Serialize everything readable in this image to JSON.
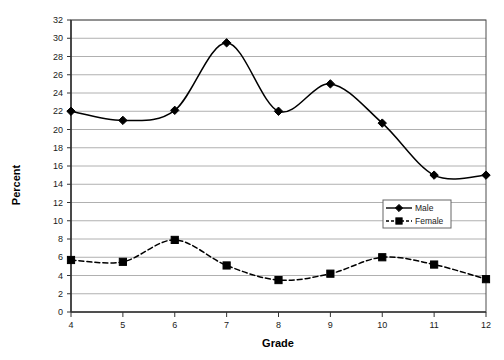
{
  "chart_data": {
    "type": "line",
    "title": "",
    "xlabel": "Grade",
    "ylabel": "Percent",
    "x": [
      4,
      5,
      6,
      7,
      8,
      9,
      10,
      11,
      12
    ],
    "categories": [
      "4",
      "5",
      "6",
      "7",
      "8",
      "9",
      "10",
      "11",
      "12"
    ],
    "xlim": [
      4,
      12
    ],
    "ylim": [
      0,
      32
    ],
    "ytick_step": 2,
    "yticks": [
      0,
      2,
      4,
      6,
      8,
      10,
      12,
      14,
      16,
      18,
      20,
      22,
      24,
      26,
      28,
      30,
      32
    ],
    "ytick_labels": [
      "0",
      "2",
      "4",
      "6",
      "8",
      "10",
      "12",
      "14",
      "16",
      "18",
      "20",
      "22",
      "24",
      "26",
      "28",
      "30",
      "32"
    ],
    "xticks": [
      4,
      5,
      6,
      7,
      8,
      9,
      10,
      11,
      12
    ],
    "xtick_labels": [
      "4",
      "5",
      "6",
      "7",
      "8",
      "9",
      "10",
      "11",
      "12"
    ],
    "grid": "horizontal",
    "grid_color": "#b0b0b0",
    "axis_color": "#4d4d4d",
    "smoothing": true,
    "legend_position": "inside-lower-right",
    "series": [
      {
        "name": "Male",
        "values": [
          22.0,
          21.0,
          22.1,
          29.5,
          22.0,
          25.0,
          20.7,
          15.0,
          15.0
        ],
        "line_style": "solid",
        "marker": "diamond",
        "color": "#000000"
      },
      {
        "name": "Female",
        "values": [
          5.7,
          5.5,
          7.9,
          5.1,
          3.5,
          4.2,
          6.0,
          5.2,
          3.6
        ],
        "line_style": "dashed",
        "marker": "square",
        "color": "#000000"
      }
    ]
  },
  "legend": {
    "entries": [
      {
        "label": "Male"
      },
      {
        "label": "Female"
      }
    ]
  }
}
